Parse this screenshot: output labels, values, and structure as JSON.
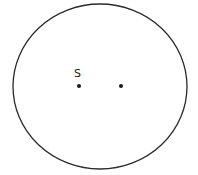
{
  "diagram": {
    "boundary": {
      "shape": "ellipse",
      "cx": 100,
      "cy": 86.5,
      "rx": 87,
      "ry": 82.5,
      "stroke": "#2a2a2a",
      "stroke_width": 1.3
    },
    "points": [
      {
        "id": "S",
        "label": "S",
        "x": 79,
        "y": 86,
        "r": 2
      },
      {
        "id": "unlabeled",
        "label": "",
        "x": 121,
        "y": 86,
        "r": 2
      }
    ],
    "labels": {
      "s_label": "S"
    },
    "colors": {
      "ink": "#1a1a1a",
      "background": "#ffffff"
    }
  }
}
